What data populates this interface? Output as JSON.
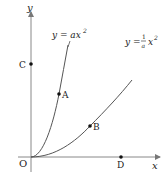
{
  "diagram": {
    "axes": {
      "x_label": "x",
      "y_label": "y",
      "origin_label": "O"
    },
    "curves": [
      {
        "id": "steep",
        "label_lhs": "y = ax",
        "label_exp": "2",
        "equation": "y = ax^2"
      },
      {
        "id": "shallow",
        "label_lhs": "y = ",
        "label_num": "1",
        "label_den": "a",
        "label_var": "x",
        "label_exp": "2",
        "equation": "y = (1/a)x^2"
      }
    ],
    "points": [
      {
        "label": "A",
        "on": "y = ax^2"
      },
      {
        "label": "B",
        "on": "y = (1/a)x^2"
      },
      {
        "label": "C",
        "on": "y-axis"
      },
      {
        "label": "D",
        "on": "x-axis"
      }
    ],
    "colors": {
      "axis": "#777777",
      "curve": "#555555",
      "point": "#111111",
      "text": "#222222"
    }
  }
}
